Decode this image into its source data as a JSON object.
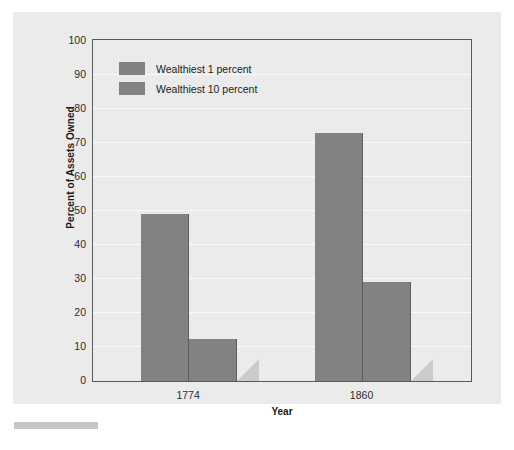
{
  "chart_data": {
    "type": "bar",
    "title": "",
    "categories": [
      "1774",
      "1860"
    ],
    "series": [
      {
        "name": "Wealthiest 1 percent",
        "values": [
          49,
          73
        ],
        "color": "#828282"
      },
      {
        "name": "Wealthiest 10 percent",
        "values": [
          12.5,
          29
        ],
        "color": "#828282"
      }
    ],
    "xlabel": "Year",
    "ylabel": "Percent of Assets Owned",
    "ylim": [
      0,
      100
    ],
    "yticks": [
      0,
      10,
      20,
      30,
      40,
      50,
      60,
      70,
      80,
      90,
      100
    ],
    "ytick_labels": [
      "0",
      "10",
      "20",
      "30",
      "40",
      "50",
      "60",
      "70",
      "80",
      "90",
      "100"
    ],
    "grid": true,
    "legend_position": "top-left",
    "panel_color": "#ebebeb",
    "gridline_color": "#fafafa",
    "frame_color": "#59595b",
    "shadow_color": "#c9c9c9"
  },
  "axes": {
    "y_title": "Percent of Assets Owned",
    "x_title": "Year"
  },
  "legend": {
    "entries": [
      {
        "label": "Wealthiest 1 percent"
      },
      {
        "label": "Wealthiest 10 percent"
      }
    ]
  }
}
